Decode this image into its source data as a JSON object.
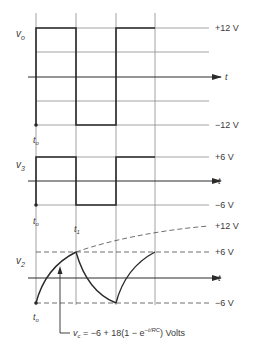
{
  "figure": {
    "panels": [
      {
        "id": "vo",
        "signal_label": "v",
        "signal_sub": "o",
        "levels": [
          "+12 V",
          "−12 V"
        ],
        "axis_label": "t",
        "time_origin_label": "t",
        "time_origin_sub": "o"
      },
      {
        "id": "v3",
        "signal_label": "v",
        "signal_sub": "3",
        "levels": [
          "+6 V",
          "−6 V"
        ],
        "axis_label": "t",
        "time_origin_label": "t",
        "time_origin_sub": "o"
      },
      {
        "id": "v2",
        "signal_label": "v",
        "signal_sub": "2",
        "levels": [
          "+12 V",
          "+6 V",
          "−6 V"
        ],
        "axis_label": "t",
        "time_origin_label": "t",
        "time_origin_sub": "o",
        "marker_label": "t",
        "marker_sub": "1"
      }
    ],
    "annotation": {
      "lhs": "v",
      "lhs_sub": "c",
      "eq_part1": " = −6 + 18(1 − e",
      "exponent": "−t/RC",
      "eq_part2": ") Volts"
    }
  },
  "colors": {
    "ink": "#2a2a2a",
    "grid": "#8a8a8a",
    "background": "#ffffff"
  }
}
